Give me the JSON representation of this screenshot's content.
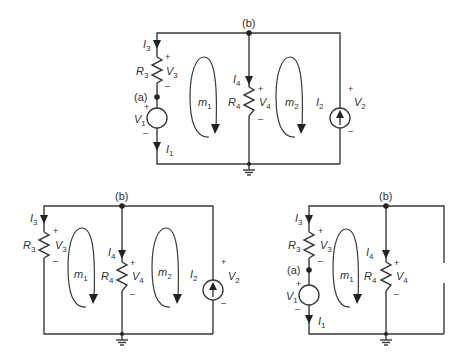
{
  "diagram": {
    "type": "circuit-schematics",
    "background": "#ffffff",
    "line_color": "#3a3a3a",
    "circuits": [
      {
        "id": "full",
        "description": "Full circuit with two meshes",
        "labels": {
          "node_b": "(b)",
          "node_a": "(a)",
          "I3": {
            "main": "I",
            "sub": "3"
          },
          "R3": {
            "main": "R",
            "sub": "3"
          },
          "V3": {
            "main": "V",
            "sub": "3"
          },
          "V1": {
            "main": "V",
            "sub": "1"
          },
          "I1": {
            "main": "I",
            "sub": "1"
          },
          "m1": {
            "main": "m",
            "sub": "1"
          },
          "I4": {
            "main": "I",
            "sub": "4"
          },
          "R4": {
            "main": "R",
            "sub": "4"
          },
          "V4": {
            "main": "V",
            "sub": "4"
          },
          "m2": {
            "main": "m",
            "sub": "2"
          },
          "I2": {
            "main": "I",
            "sub": "2"
          },
          "V2": {
            "main": "V",
            "sub": "2"
          },
          "plus": "+",
          "minus": "–"
        }
      },
      {
        "id": "v1-killed",
        "description": "Circuit with V1 replaced by short",
        "labels": {
          "node_b": "(b)",
          "I3": {
            "main": "I",
            "sub": "3"
          },
          "R3": {
            "main": "R",
            "sub": "3"
          },
          "V3": {
            "main": "V",
            "sub": "3"
          },
          "m1": {
            "main": "m",
            "sub": "1"
          },
          "I4": {
            "main": "I",
            "sub": "4"
          },
          "R4": {
            "main": "R",
            "sub": "4"
          },
          "V4": {
            "main": "V",
            "sub": "4"
          },
          "m2": {
            "main": "m",
            "sub": "2"
          },
          "I2": {
            "main": "I",
            "sub": "2"
          },
          "V2": {
            "main": "V",
            "sub": "2"
          },
          "plus": "+",
          "minus": "–"
        }
      },
      {
        "id": "i2-killed",
        "description": "Circuit with I2 replaced by open",
        "labels": {
          "node_b": "(b)",
          "node_a": "(a)",
          "I3": {
            "main": "I",
            "sub": "3"
          },
          "R3": {
            "main": "R",
            "sub": "3"
          },
          "V3": {
            "main": "V",
            "sub": "3"
          },
          "V1": {
            "main": "V",
            "sub": "1"
          },
          "I1": {
            "main": "I",
            "sub": "1"
          },
          "m1": {
            "main": "m",
            "sub": "1"
          },
          "I4": {
            "main": "I",
            "sub": "4"
          },
          "R4": {
            "main": "R",
            "sub": "4"
          },
          "V4": {
            "main": "V",
            "sub": "4"
          },
          "plus": "+",
          "minus": "–"
        }
      }
    ]
  }
}
